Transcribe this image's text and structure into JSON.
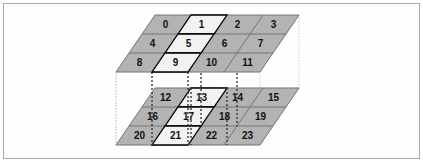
{
  "figure": {
    "background_color": "#ffffff",
    "border_color": "#a8a8a8"
  },
  "colors": {
    "plane_fill": "#b3b3b3",
    "cell_fill_normal": "#b3b3b3",
    "cell_fill_highlight": "#f2f2f2",
    "grid_line": "#6e6e6e",
    "highlight_outline": "#000000",
    "dotted_guide": "#3a3a3a",
    "faint_box": "#cccccc",
    "label_color": "#111111"
  },
  "geometry": {
    "cols": 4,
    "rows": 3,
    "cell_width": 36,
    "row_height": 19,
    "skew_dx": 13,
    "top_plane_origin": {
      "x": 155,
      "y": 15
    },
    "bottom_plane_origin": {
      "x": 155,
      "y": 88
    },
    "plane_gap": 73
  },
  "planes": [
    {
      "id": "top-plane",
      "name": "upper-layer",
      "origin": {
        "x": 155,
        "y": 15
      },
      "cells": [
        {
          "id": 0,
          "label": "0",
          "col": 0,
          "row": 0,
          "highlight": false
        },
        {
          "id": 1,
          "label": "1",
          "col": 1,
          "row": 0,
          "highlight": true
        },
        {
          "id": 2,
          "label": "2",
          "col": 2,
          "row": 0,
          "highlight": false
        },
        {
          "id": 3,
          "label": "3",
          "col": 3,
          "row": 0,
          "highlight": false
        },
        {
          "id": 4,
          "label": "4",
          "col": 0,
          "row": 1,
          "highlight": false
        },
        {
          "id": 5,
          "label": "5",
          "col": 1,
          "row": 1,
          "highlight": true
        },
        {
          "id": 6,
          "label": "6",
          "col": 2,
          "row": 1,
          "highlight": false
        },
        {
          "id": 7,
          "label": "7",
          "col": 3,
          "row": 1,
          "highlight": false
        },
        {
          "id": 8,
          "label": "8",
          "col": 0,
          "row": 2,
          "highlight": false
        },
        {
          "id": 9,
          "label": "9",
          "col": 1,
          "row": 2,
          "highlight": true
        },
        {
          "id": 10,
          "label": "10",
          "col": 2,
          "row": 2,
          "highlight": false
        },
        {
          "id": 11,
          "label": "11",
          "col": 3,
          "row": 2,
          "highlight": false
        }
      ]
    },
    {
      "id": "bottom-plane",
      "name": "lower-layer",
      "origin": {
        "x": 155,
        "y": 88
      },
      "cells": [
        {
          "id": 12,
          "label": "12",
          "col": 0,
          "row": 0,
          "highlight": false
        },
        {
          "id": 13,
          "label": "13",
          "col": 1,
          "row": 0,
          "highlight": true
        },
        {
          "id": 14,
          "label": "14",
          "col": 2,
          "row": 0,
          "highlight": false
        },
        {
          "id": 15,
          "label": "15",
          "col": 3,
          "row": 0,
          "highlight": false
        },
        {
          "id": 16,
          "label": "16",
          "col": 0,
          "row": 1,
          "highlight": false
        },
        {
          "id": 17,
          "label": "17",
          "col": 1,
          "row": 1,
          "highlight": true
        },
        {
          "id": 18,
          "label": "18",
          "col": 2,
          "row": 1,
          "highlight": false
        },
        {
          "id": 19,
          "label": "19",
          "col": 3,
          "row": 1,
          "highlight": false
        },
        {
          "id": 20,
          "label": "20",
          "col": 0,
          "row": 2,
          "highlight": false
        },
        {
          "id": 21,
          "label": "21",
          "col": 1,
          "row": 2,
          "highlight": true
        },
        {
          "id": 22,
          "label": "22",
          "col": 2,
          "row": 2,
          "highlight": false
        },
        {
          "id": 23,
          "label": "23",
          "col": 3,
          "row": 2,
          "highlight": false
        }
      ]
    }
  ],
  "connector_lines": {
    "name": "vertical-dotted-connectors",
    "count": 4,
    "dash": "2,2"
  }
}
